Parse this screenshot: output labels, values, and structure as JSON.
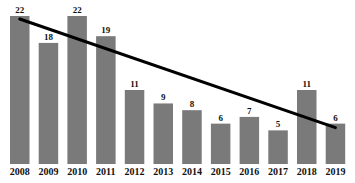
{
  "chart_data": {
    "type": "bar",
    "title": "",
    "xlabel": "",
    "ylabel": "",
    "categories": [
      "2008",
      "2009",
      "2010",
      "2011",
      "2012",
      "2013",
      "2014",
      "2015",
      "2016",
      "2017",
      "2018",
      "2019"
    ],
    "values": [
      22,
      18,
      22,
      19,
      11,
      9,
      8,
      6,
      7,
      5,
      11,
      6
    ],
    "ylim": [
      0,
      23
    ],
    "grid": false,
    "legend": null,
    "data_labels": true,
    "bar_color": "#7a7a7a",
    "trend_line": {
      "type": "linear",
      "color": "#000000",
      "from": {
        "category": "2008",
        "value": 22
      },
      "to": {
        "category": "2019",
        "value": 6
      }
    }
  }
}
